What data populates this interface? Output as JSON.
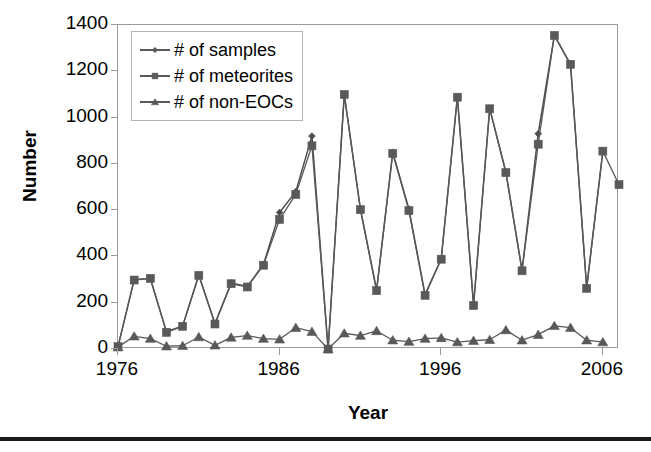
{
  "chart_data": {
    "type": "line",
    "title": "",
    "xlabel": "Year",
    "ylabel": "Number",
    "xlim": [
      1976,
      2007
    ],
    "ylim": [
      0,
      1400
    ],
    "ytick_values": [
      0,
      200,
      400,
      600,
      800,
      1000,
      1200,
      1400
    ],
    "ytick_labels": [
      "0",
      "200",
      "400",
      "600",
      "800",
      "1000",
      "1200",
      "1400"
    ],
    "xtick_values": [
      1976,
      1986,
      1996,
      2006
    ],
    "xtick_labels": [
      "1976",
      "1986",
      "1996",
      "2006"
    ],
    "grid": false,
    "legend_position": "upper-left",
    "x": [
      1976,
      1977,
      1978,
      1979,
      1980,
      1981,
      1982,
      1983,
      1984,
      1985,
      1986,
      1987,
      1988,
      1989,
      1990,
      1991,
      1992,
      1993,
      1994,
      1995,
      1996,
      1997,
      1998,
      1999,
      2000,
      2001,
      2002,
      2003,
      2004,
      2005,
      2006
    ],
    "series": [
      {
        "name": "# of samples",
        "marker": "diamond",
        "color": "#4d4d4d",
        "values": [
          10,
          300,
          305,
          75,
          100,
          320,
          110,
          285,
          270,
          365,
          590,
          680,
          920,
          0,
          1100,
          605,
          255,
          850,
          605,
          235,
          390,
          1090,
          190,
          1040,
          765,
          340,
          930,
          1355,
          1230,
          265,
          855
        ]
      },
      {
        "name": "# of meteorites",
        "marker": "square",
        "color": "#595959",
        "values": [
          10,
          298,
          305,
          72,
          98,
          318,
          108,
          282,
          268,
          362,
          560,
          668,
          878,
          0,
          1100,
          602,
          252,
          845,
          598,
          232,
          388,
          1088,
          188,
          1038,
          762,
          338,
          885,
          1355,
          1230,
          262,
          855
        ]
      },
      {
        "name": "# of non-EOCs",
        "marker": "triangle",
        "color": "#595959",
        "values": [
          8,
          55,
          45,
          12,
          14,
          52,
          16,
          50,
          58,
          45,
          42,
          92,
          75,
          0,
          68,
          58,
          78,
          38,
          32,
          45,
          48,
          30,
          36,
          40,
          82,
          38,
          62,
          100,
          92,
          38,
          30
        ]
      }
    ],
    "extra_points": [
      {
        "series": "# of meteorites",
        "x": 2007,
        "y": 710,
        "note": "final meteorite point beyond 2006 tick"
      }
    ]
  },
  "legend": {
    "items": [
      {
        "label": "# of samples",
        "marker": "diamond"
      },
      {
        "label": "# of meteorites",
        "marker": "square"
      },
      {
        "label": "# of non-EOCs",
        "marker": "triangle"
      }
    ]
  },
  "axis": {
    "ylabel": "Number",
    "xlabel": "Year"
  },
  "colors": {
    "line": "#595959",
    "marker": "#5a5a5a",
    "frame": "#9a9a9a",
    "text": "#000000",
    "rule": "#1a1a1a"
  }
}
